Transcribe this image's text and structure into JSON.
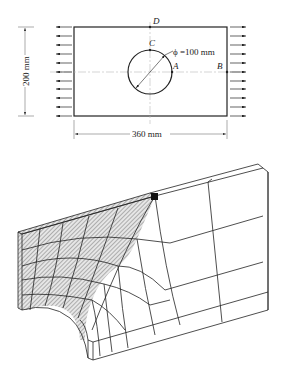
{
  "top_figure": {
    "points": {
      "A": "A",
      "B": "B",
      "C": "C",
      "D": "D"
    },
    "diameter_label": "ϕ =100 mm",
    "height_label": "200 mm",
    "width_label": "360 mm",
    "arrow_count_per_side": 11
  },
  "bottom_figure": {
    "description": "3D finite element mesh of quarter plate with hole, hatched refined region"
  }
}
